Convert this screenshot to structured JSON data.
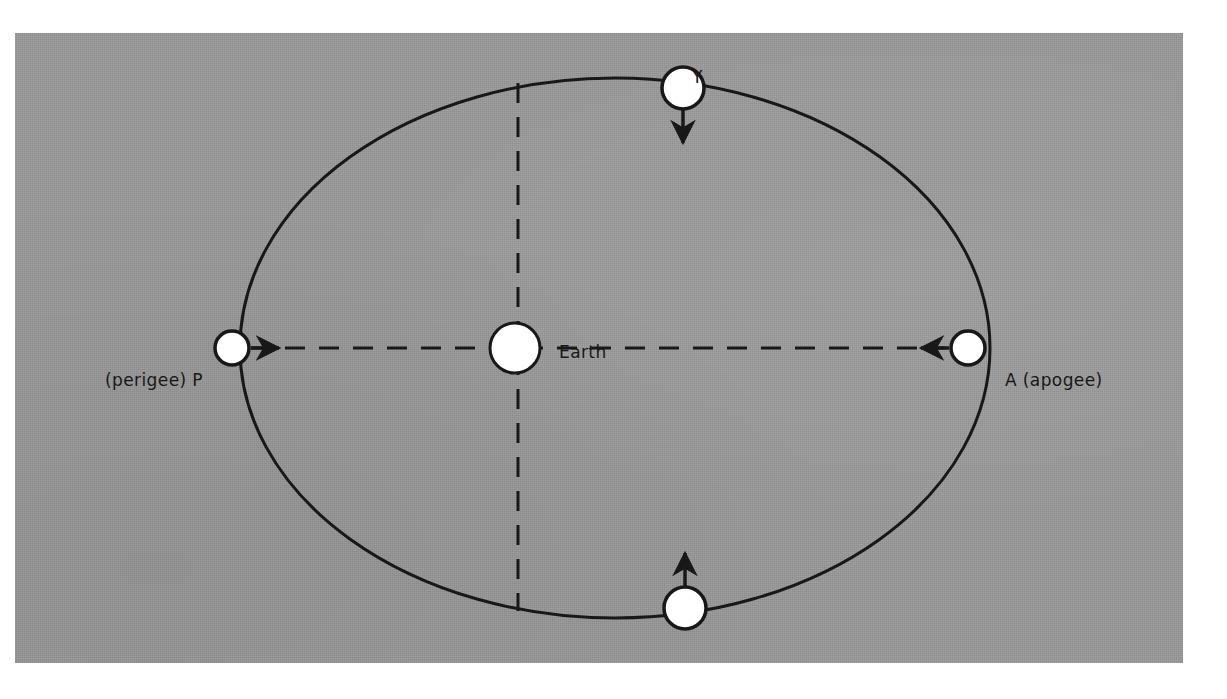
{
  "figure": {
    "type": "orbit-diagram",
    "background_color": "#9a9a9a",
    "ink_color": "#181818",
    "body_fill_color": "#ffffff",
    "panel": {
      "x": 15,
      "y": 33,
      "width": 1168,
      "height": 630
    },
    "labels": {
      "perigee": "(perigee) P",
      "apogee": "A (apogee)",
      "earth": "Earth",
      "point_y": "Y",
      "point_x": "X"
    },
    "orbit": {
      "shape": "ellipse",
      "center_x": 600,
      "center_y": 315,
      "semi_major_axis": 375,
      "semi_minor_axis": 270,
      "stroke_width": 3
    },
    "earth_body": {
      "center_x": 500,
      "center_y": 315,
      "radius": 25,
      "stroke_width": 3
    },
    "satellites": [
      {
        "name": "P",
        "center_x": 217,
        "center_y": 315,
        "radius": 17,
        "arrow": "right"
      },
      {
        "name": "A",
        "center_x": 953,
        "center_y": 315,
        "radius": 17,
        "arrow": "left"
      },
      {
        "name": "Y",
        "center_x": 668,
        "center_y": 55,
        "radius": 21,
        "arrow": "down"
      },
      {
        "name": "X",
        "center_x": 670,
        "center_y": 575,
        "radius": 21,
        "arrow": "up"
      }
    ],
    "axes": [
      {
        "name": "major-axis",
        "orientation": "horizontal",
        "style": "dashed",
        "x1": 234,
        "y1": 315,
        "x2": 936,
        "y2": 315
      },
      {
        "name": "minor-axis",
        "orientation": "vertical",
        "style": "dashed",
        "x1": 503,
        "y1": 52,
        "x2": 503,
        "y2": 575
      }
    ],
    "dash_pattern": "20 14"
  }
}
